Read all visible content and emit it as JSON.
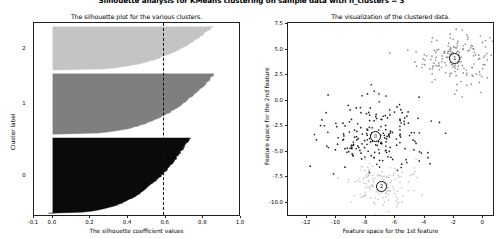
{
  "figure": {
    "suptitle": "Silhouette analysis for KMeans clustering on sample data with n_clusters = 3",
    "width": 503,
    "height": 239,
    "background": "#ffffff"
  },
  "chart_data": [
    {
      "type": "bar",
      "orientation": "horizontal",
      "name": "silhouette-plot",
      "title": "The silhouette plot for the various clusters.",
      "xlabel": "The silhouette coefficient values",
      "ylabel": "Cluster label",
      "xlim": [
        -0.1,
        1.0
      ],
      "ylim": [
        0,
        515
      ],
      "grid": false,
      "xticks": [
        "-0.1",
        "0.0",
        "0.2",
        "0.4",
        "0.6",
        "0.8",
        "1.0"
      ],
      "xtick_values": [
        -0.1,
        0.0,
        0.2,
        0.4,
        0.6,
        0.8,
        1.0
      ],
      "cluster_labels": [
        "0",
        "1",
        "2"
      ],
      "average_silhouette_score": 0.588,
      "average_line_label": "0.6",
      "clusters": [
        {
          "label": "0",
          "color": "#0a0a0a",
          "size": 200,
          "y_start": 10,
          "y_end": 210,
          "silhouette_min": -0.02,
          "silhouette_max": 0.73,
          "tag_y_center": 110
        },
        {
          "label": "1",
          "color": "#7f7f7f",
          "size": 160,
          "y_start": 220,
          "y_end": 380,
          "silhouette_min": 0.02,
          "silhouette_max": 0.86,
          "tag_y_center": 300
        },
        {
          "label": "2",
          "color": "#c4c4c4",
          "size": 115,
          "y_start": 390,
          "y_end": 505,
          "silhouette_min": 0.02,
          "silhouette_max": 0.85,
          "tag_y_center": 447
        }
      ]
    },
    {
      "type": "scatter",
      "name": "cluster-visualization",
      "title": "The visualization of the clustered data.",
      "xlabel": "Feature space for the 1st feature",
      "ylabel": "Feature space for the 2nd feature",
      "xlim": [
        -13.3,
        0.8
      ],
      "ylim": [
        -11.4,
        7.6
      ],
      "grid": false,
      "xticks": [
        "-12",
        "-10",
        "-8",
        "-6",
        "-4",
        "-2",
        "0"
      ],
      "xtick_values": [
        -12,
        -10,
        -8,
        -6,
        -4,
        -2,
        0
      ],
      "yticks": [
        "7.5",
        "5.0",
        "2.5",
        "0.0",
        "-2.5",
        "-5.0",
        "-7.5",
        "-10.0"
      ],
      "ytick_values": [
        7.5,
        5.0,
        2.5,
        0.0,
        -2.5,
        -5.0,
        -7.5,
        -10.0
      ],
      "centers": [
        {
          "label": "1",
          "x": -2.0,
          "y": 4.2,
          "color": "#555555"
        },
        {
          "label": "0",
          "x": -7.4,
          "y": -3.4,
          "color": "#333333"
        },
        {
          "label": "2",
          "x": -7.0,
          "y": -8.3,
          "color": "#bbbbbb"
        }
      ],
      "series": [
        {
          "name": "cluster-1",
          "color": "#909090",
          "n_points": 170,
          "center": [
            -2.0,
            4.2
          ],
          "spread": 1.25
        },
        {
          "name": "cluster-0",
          "color": "#1c1c1c",
          "n_points": 200,
          "center": [
            -7.4,
            -3.4
          ],
          "spread": 1.8
        },
        {
          "name": "cluster-2",
          "color": "#cccccc",
          "n_points": 150,
          "center": [
            -7.0,
            -8.3
          ],
          "spread": 1.2
        }
      ]
    }
  ]
}
